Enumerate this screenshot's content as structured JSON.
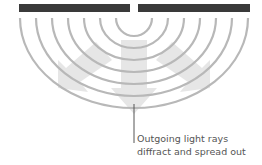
{
  "diagram": {
    "colors": {
      "barrier": "#3a3a3a",
      "wavefront": "#b8b8b8",
      "arrow": "#e6e6e6",
      "leader": "#555555",
      "text": "#555555"
    },
    "barrier": {
      "left": [
        19,
        130
      ],
      "right": [
        138,
        250
      ],
      "y": 4,
      "height": 8
    },
    "slit_center": [
      134,
      10
    ],
    "wavefront_radii": [
      18,
      34,
      50,
      66,
      82,
      98,
      115
    ],
    "arrows": [
      {
        "name": "center-arrow",
        "direction": "down"
      },
      {
        "name": "left-arrow",
        "direction": "down-left"
      },
      {
        "name": "right-arrow",
        "direction": "down-right"
      }
    ],
    "annotation": {
      "line1": "Outgoing light rays",
      "line2": "diffract and spread out"
    }
  }
}
